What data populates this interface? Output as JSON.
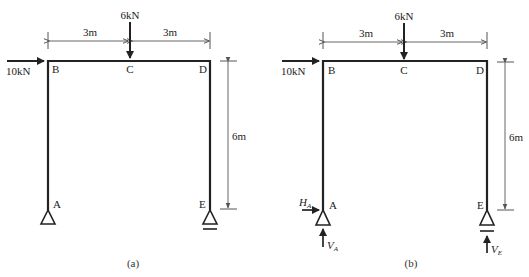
{
  "figures": [
    {
      "id": "a",
      "caption": "(a)",
      "nodes": {
        "A": "A",
        "B": "B",
        "C": "C",
        "D": "D",
        "E": "E"
      },
      "loads": {
        "horizontal": "10kN",
        "vertical": "6kN"
      },
      "dimensions": {
        "left_span": "3m",
        "right_span": "3m",
        "height": "6m"
      },
      "reactions": null
    },
    {
      "id": "b",
      "caption": "(b)",
      "nodes": {
        "A": "A",
        "B": "B",
        "C": "C",
        "D": "D",
        "E": "E"
      },
      "loads": {
        "horizontal": "10kN",
        "vertical": "6kN"
      },
      "dimensions": {
        "left_span": "3m",
        "right_span": "3m",
        "height": "6m"
      },
      "reactions": {
        "HA": {
          "symbol": "H",
          "subscript": "A"
        },
        "VA": {
          "symbol": "V",
          "subscript": "A"
        },
        "VE": {
          "symbol": "V",
          "subscript": "E"
        }
      }
    }
  ],
  "colors": {
    "member": "#222222",
    "dimension": "#555555",
    "load": "#222222"
  }
}
